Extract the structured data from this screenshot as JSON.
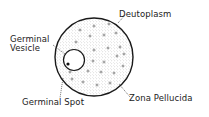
{
  "diagram": {
    "labels": {
      "deutoplasm": "Deutoplasm",
      "germinal_vesicle_line1": "Germinal",
      "germinal_vesicle_line2": "Vesicle",
      "germinal_spot": "Germinal Spot",
      "zona_pellucida": "Zona Pellucida"
    },
    "colors": {
      "ink": "#222222",
      "stipple": "#8a8a8a",
      "background": "#ffffff"
    }
  }
}
